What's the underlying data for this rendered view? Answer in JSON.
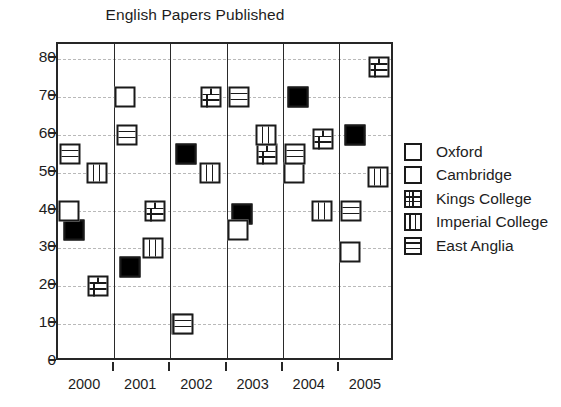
{
  "chart_data": {
    "type": "scatter",
    "title": "English Papers Published",
    "xlabel": "",
    "ylabel": "",
    "categories": [
      "2000",
      "2001",
      "2002",
      "2003",
      "2004",
      "2005"
    ],
    "yticks": [
      0,
      10,
      20,
      30,
      40,
      50,
      60,
      70,
      80
    ],
    "ylim": [
      0,
      84
    ],
    "grid": true,
    "legend_position": "right",
    "series": [
      {
        "name": "Oxford",
        "marker": "solid-black-square",
        "values": [
          35,
          25,
          55,
          39,
          70,
          60
        ]
      },
      {
        "name": "Cambridge",
        "marker": "empty-white-square",
        "values": [
          40,
          70,
          10,
          35,
          50,
          29
        ]
      },
      {
        "name": "Kings College",
        "marker": "brick-pattern-square",
        "values": [
          20,
          40,
          70,
          55,
          59,
          78
        ]
      },
      {
        "name": "Imperial College",
        "marker": "vertical-stripe-square",
        "values": [
          50,
          30,
          50,
          60,
          40,
          49
        ]
      },
      {
        "name": "East Anglia",
        "marker": "horizontal-stripe-square",
        "values": [
          55,
          60,
          10,
          70,
          55,
          40
        ]
      }
    ]
  },
  "title": {
    "text": "English Papers Published"
  },
  "axis": {
    "y_tick_labels": [
      "80",
      "70",
      "60",
      "50",
      "40",
      "30",
      "20",
      "10",
      "0"
    ],
    "x_tick_labels": [
      "2000",
      "2001",
      "2002",
      "2003",
      "2004",
      "2005"
    ]
  },
  "legend": {
    "items": [
      {
        "label": "Oxford",
        "marker_class": "m-oxford",
        "icon": "solid-black-square-icon"
      },
      {
        "label": "Cambridge",
        "marker_class": "m-cambridge",
        "icon": "empty-white-square-icon"
      },
      {
        "label": "Kings College",
        "marker_class": "m-kings",
        "icon": "brick-square-icon"
      },
      {
        "label": "Imperial College",
        "marker_class": "m-imperial",
        "icon": "vertical-stripe-square-icon"
      },
      {
        "label": "East Anglia",
        "marker_class": "m-eastanglia",
        "icon": "horizontal-stripe-square-icon"
      }
    ]
  },
  "colors": {
    "axis": "#262626",
    "grid": "#b9b9b9",
    "text": "#1d1d1d",
    "marker_fill_solid": "#000000",
    "marker_fill_empty": "#ffffff",
    "background": "#ffffff"
  },
  "marker_offsets": {
    "Oxford": -0.22,
    "Cambridge": -0.3,
    "Kings College": 0.22,
    "Imperial College": 0.2,
    "East Anglia": -0.28
  }
}
